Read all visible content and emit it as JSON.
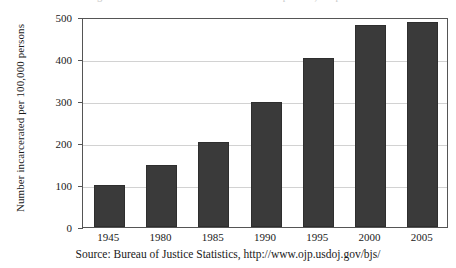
{
  "figure": {
    "clipped_title": "Figure: Incarceration rate in the United States per 100,000 persons",
    "source_caption": "Source: Bureau of Justice Statistics, http://www.ojp.usdoj.gov/bjs/"
  },
  "chart_data": {
    "type": "bar",
    "title": "",
    "xlabel": "",
    "ylabel": "Number incarcerated per 100,000 persons",
    "categories": [
      "1945",
      "1980",
      "1985",
      "1990",
      "1995",
      "2000",
      "2005"
    ],
    "values": [
      100,
      147,
      202,
      297,
      403,
      481,
      488
    ],
    "ylim": [
      0,
      500
    ],
    "yticks": [
      0,
      100,
      200,
      300,
      400,
      500
    ],
    "ytick_labels": [
      "0",
      "100",
      "200",
      "300",
      "400",
      "500"
    ],
    "grid": true,
    "grid_axis": "y",
    "legend": false,
    "bar_color": "#3a3a3a",
    "frame_color": "#555555",
    "gridline_color": "#d2d2d2"
  }
}
